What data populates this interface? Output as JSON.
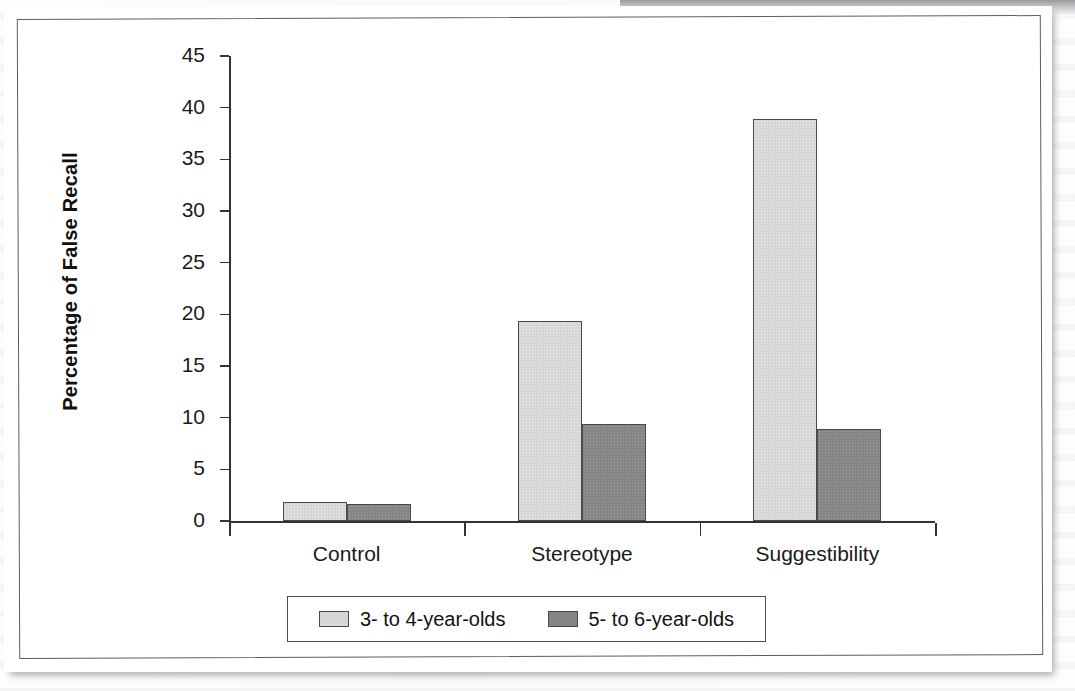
{
  "chart_data": {
    "type": "bar",
    "title": "",
    "xlabel": "",
    "ylabel": "Percentage of False Recall",
    "categories": [
      "Control",
      "Stereotype",
      "Suggestibility"
    ],
    "series": [
      {
        "name": "3- to 4-year-olds",
        "color": "#d6d6d6",
        "values": [
          1.8,
          19.4,
          38.9
        ]
      },
      {
        "name": "5- to 6-year-olds",
        "color": "#858585",
        "values": [
          1.6,
          9.4,
          8.9
        ]
      }
    ],
    "ylim": [
      0,
      45
    ],
    "yticks": [
      0,
      5,
      10,
      15,
      20,
      25,
      30,
      35,
      40,
      45
    ],
    "ytick_labels": [
      "0",
      "5",
      "10",
      "15",
      "20",
      "25",
      "30",
      "35",
      "40",
      "45"
    ],
    "grid": false,
    "legend_position": "bottom"
  },
  "figure": {
    "frame_color": "#5b5d61",
    "background": "#ffffff",
    "axis_color": "#333333"
  }
}
